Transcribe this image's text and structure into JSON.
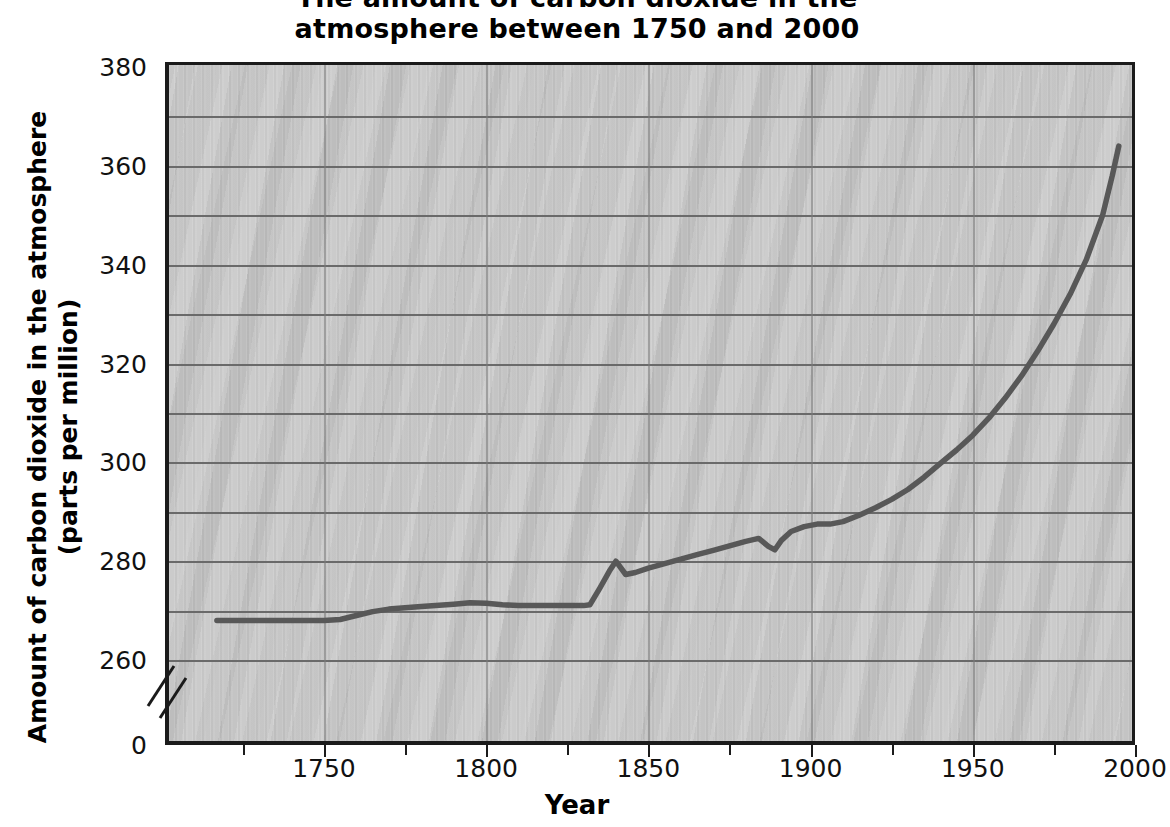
{
  "title": {
    "line1": "The amount of carbon dioxide in the",
    "line2": "atmosphere between 1750 and 2000"
  },
  "axes": {
    "y_title_line1": "Amount of carbon dioxide in the atmosphere",
    "y_title_line2": "(parts per million)",
    "x_title": "Year",
    "y_ticks": [
      "380",
      "360",
      "340",
      "320",
      "300",
      "280",
      "260",
      "0"
    ],
    "x_ticks": [
      "1750",
      "1800",
      "1850",
      "1900",
      "1950",
      "2000"
    ],
    "axis_break_symbol": "//"
  },
  "colors": {
    "plot_background": "#c6c6c6",
    "gridline": "#6a6a6a",
    "axis": "#1b1b1b",
    "series_line": "#585858",
    "page_background": "#ffffff",
    "text": "#111111"
  },
  "chart_data": {
    "type": "line",
    "title": "The amount of carbon dioxide in the atmosphere between 1750 and 2000",
    "xlabel": "Year",
    "ylabel": "Amount of carbon dioxide in the atmosphere (parts per million)",
    "xlim": [
      1701,
      2000
    ],
    "ylim": [
      0,
      380
    ],
    "y_axis_broken": true,
    "y_break_between": [
      0,
      260
    ],
    "y_tick_values": [
      0,
      260,
      280,
      300,
      320,
      340,
      360,
      380
    ],
    "y_gridline_interval": 10,
    "x_tick_values": [
      1750,
      1800,
      1850,
      1900,
      1950,
      2000
    ],
    "grid": true,
    "legend": "none",
    "series": [
      {
        "name": "Atmospheric CO2 concentration",
        "units": "parts per million",
        "x": [
          1717,
          1730,
          1740,
          1750,
          1755,
          1760,
          1765,
          1770,
          1780,
          1790,
          1795,
          1800,
          1805,
          1810,
          1815,
          1820,
          1825,
          1830,
          1832,
          1835,
          1838,
          1840,
          1843,
          1846,
          1850,
          1855,
          1860,
          1865,
          1870,
          1875,
          1880,
          1884,
          1887,
          1889,
          1891,
          1894,
          1898,
          1902,
          1906,
          1910,
          1915,
          1920,
          1925,
          1930,
          1935,
          1940,
          1945,
          1950,
          1955,
          1960,
          1965,
          1970,
          1975,
          1980,
          1985,
          1990,
          1993,
          1995
        ],
        "y": [
          268.0,
          268.0,
          268.0,
          268.0,
          268.2,
          269.0,
          269.8,
          270.3,
          270.8,
          271.3,
          271.6,
          271.5,
          271.2,
          271.0,
          271.0,
          271.0,
          271.0,
          271.0,
          271.2,
          274.5,
          278.0,
          280.0,
          277.3,
          277.7,
          278.6,
          279.5,
          280.4,
          281.3,
          282.2,
          283.1,
          284.0,
          284.6,
          283.0,
          282.3,
          284.2,
          286.0,
          287.0,
          287.5,
          287.5,
          288.0,
          289.3,
          290.8,
          292.5,
          294.5,
          297.0,
          299.8,
          302.5,
          305.5,
          309.0,
          313.0,
          317.5,
          322.5,
          328.0,
          334.0,
          341.0,
          350.0,
          358.0,
          364.0
        ]
      }
    ]
  }
}
